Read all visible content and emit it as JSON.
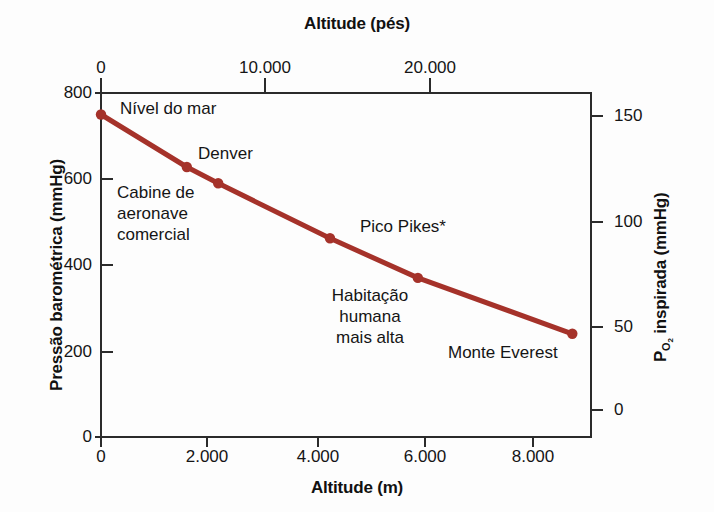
{
  "chart_data": {
    "type": "line",
    "title": "",
    "xlabel": "Altitude (m)",
    "ylabel": "Pressão barométrica (mmHg)",
    "x2label": "Altitude (pés)",
    "y2label": "P_O2 inspirada (mmHg)",
    "xlim": [
      0,
      9200
    ],
    "ylim": [
      0,
      800
    ],
    "x2lim": [
      0,
      30184
    ],
    "y2lim": [
      0,
      168
    ],
    "grid": false,
    "legend": null,
    "xticks": [
      0,
      2000,
      4000,
      6000,
      8000
    ],
    "xticklabels": [
      "0",
      "2.000",
      "4.000",
      "6.000",
      "8.000"
    ],
    "yticks": [
      0,
      200,
      400,
      600,
      800
    ],
    "yticklabels": [
      "0",
      "200",
      "400",
      "600",
      "800"
    ],
    "x2ticks": [
      0,
      10000,
      20000
    ],
    "x2ticklabels": [
      "0",
      "10.000",
      "20.000"
    ],
    "y2ticks": [
      0,
      50,
      100,
      150
    ],
    "y2ticklabels": [
      "0",
      "50",
      "100",
      "150"
    ],
    "series": [
      {
        "name": "Pressão barométrica vs altitude",
        "color": "#A5322A",
        "x": [
          0,
          1610,
          2200,
          4300,
          5950,
          8848
        ],
        "values": [
          750,
          628,
          590,
          462,
          370,
          240
        ]
      }
    ],
    "points": [
      {
        "label": "Nível do mar",
        "altitude_m": 0,
        "pressure_mmHg": 750
      },
      {
        "label": "Denver",
        "altitude_m": 1610,
        "pressure_mmHg": 628
      },
      {
        "label": "Cabine de aeronave comercial",
        "altitude_m": 2200,
        "pressure_mmHg": 590
      },
      {
        "label": "Pico Pikes*",
        "altitude_m": 4300,
        "pressure_mmHg": 462
      },
      {
        "label": "Habitação humana mais alta",
        "altitude_m": 5950,
        "pressure_mmHg": 370
      },
      {
        "label": "Monte Everest",
        "altitude_m": 8848,
        "pressure_mmHg": 240
      }
    ],
    "annotations": [
      {
        "text": "Nível do mar"
      },
      {
        "text": "Denver"
      },
      {
        "text": "Cabine de\naeronave\ncomercial"
      },
      {
        "text": "Pico Pikes*"
      },
      {
        "text": "Habitação\nhumana\nmais alta"
      },
      {
        "text": "Monte Everest"
      }
    ]
  },
  "axes": {
    "top_title": "Altitude (pés)",
    "bottom_title": "Altitude (m)",
    "left_title": "Pressão barométrica (mmHg)",
    "right_title_main": "inspirada (mmHg)",
    "right_title_symbol": "P",
    "right_title_sub": "O",
    "right_title_sub2": "2"
  },
  "ticks": {
    "top": [
      "0",
      "10.000",
      "20.000"
    ],
    "bottom": [
      "0",
      "2.000",
      "4.000",
      "6.000",
      "8.000"
    ],
    "left": [
      "800",
      "600",
      "400",
      "200",
      "0"
    ],
    "right": [
      "150",
      "100",
      "50",
      "0"
    ]
  },
  "annotations": {
    "sea_level": "Nível do mar",
    "denver": "Denver",
    "cabin_l1": "Cabine de",
    "cabin_l2": "aeronave",
    "cabin_l3": "comercial",
    "pikes": "Pico Pikes*",
    "habit_l1": "Habitação",
    "habit_l2": "humana",
    "habit_l3": "mais alta",
    "everest": "Monte Everest"
  },
  "colors": {
    "line": "#A5322A",
    "frame": "#2b2b2b",
    "text": "#151515",
    "background": "#fdfdfd"
  }
}
